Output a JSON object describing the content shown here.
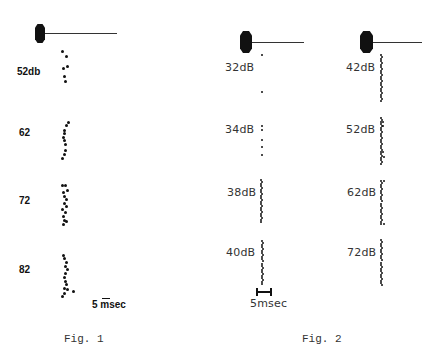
{
  "fig1": {
    "caption": "Fig. 1",
    "scale_label_num": "5",
    "scale_label_unit": "msec",
    "rows": [
      {
        "label": "52db",
        "label_x": 17,
        "label_y": 66
      },
      {
        "label": "62",
        "label_x": 19,
        "label_y": 127
      },
      {
        "label": "72",
        "label_x": 19,
        "label_y": 195
      },
      {
        "label": "82",
        "label_x": 19,
        "label_y": 264
      }
    ]
  },
  "fig2": {
    "caption": "Fig. 2",
    "scale_label": "5msec",
    "columns": [
      {
        "rows": [
          {
            "label": "32dB",
            "label_x": 225,
            "label_y": 61
          },
          {
            "label": "34dB",
            "label_x": 225,
            "label_y": 123
          },
          {
            "label": "38dB",
            "label_x": 227,
            "label_y": 186
          },
          {
            "label": "40dB",
            "label_x": 226,
            "label_y": 246
          }
        ]
      },
      {
        "rows": [
          {
            "label": "42dB",
            "label_x": 346,
            "label_y": 61
          },
          {
            "label": "52dB",
            "label_x": 346,
            "label_y": 123
          },
          {
            "label": "62dB",
            "label_x": 347,
            "label_y": 186
          },
          {
            "label": "72dB",
            "label_x": 347,
            "label_y": 246
          }
        ]
      }
    ]
  },
  "chart_data": [
    {
      "type": "scatter",
      "title": "Fig. 1",
      "xlabel": "time (scale bar 5 msec)",
      "ylabel": "stimulus intensity",
      "series": [
        {
          "name": "52db",
          "points": [
            [
              62,
              51
            ],
            [
              66,
              56
            ],
            [
              63,
              68
            ],
            [
              67,
              66
            ],
            [
              64,
              76
            ],
            [
              65,
              81
            ]
          ]
        },
        {
          "name": "62",
          "points": [
            [
              68,
              122
            ],
            [
              66,
              125
            ],
            [
              64,
              130
            ],
            [
              64,
              133
            ],
            [
              63,
              137
            ],
            [
              64,
              140
            ],
            [
              65,
              144
            ],
            [
              65,
              150
            ],
            [
              64,
              154
            ],
            [
              62,
              158
            ]
          ]
        },
        {
          "name": "72",
          "points": [
            [
              62,
              185
            ],
            [
              65,
              185
            ],
            [
              67,
              190
            ],
            [
              63,
              192
            ],
            [
              64,
              196
            ],
            [
              66,
              199
            ],
            [
              64,
              203
            ],
            [
              66,
              206
            ],
            [
              62,
              209
            ],
            [
              65,
              212
            ],
            [
              63,
              216
            ],
            [
              64,
              220
            ],
            [
              66,
              221
            ],
            [
              63,
              224
            ]
          ]
        },
        {
          "name": "82",
          "points": [
            [
              63,
              255
            ],
            [
              64,
              258
            ],
            [
              66,
              262
            ],
            [
              65,
              266
            ],
            [
              67,
              269
            ],
            [
              65,
              273
            ],
            [
              64,
              277
            ],
            [
              65,
              281
            ],
            [
              66,
              284
            ],
            [
              64,
              288
            ],
            [
              67,
              289
            ],
            [
              64,
              293
            ],
            [
              62,
              296
            ],
            [
              73,
              291
            ]
          ]
        }
      ],
      "scale_bar": {
        "label": "5 msec",
        "x1": 102,
        "x2": 109,
        "y": 299
      }
    },
    {
      "type": "scatter",
      "title": "Fig. 2",
      "xlabel": "time (scale bar 5 msec)",
      "ylabel": "stimulus intensity",
      "series": [
        {
          "name": "32dB",
          "points": [
            [
              262,
              55
            ],
            [
              262,
              92
            ]
          ]
        },
        {
          "name": "34dB",
          "points": [
            [
              262,
              126
            ],
            [
              262,
              130
            ],
            [
              262,
              140
            ],
            [
              262,
              147
            ],
            [
              262,
              155
            ]
          ]
        },
        {
          "name": "38dB",
          "dense_column": {
            "x": 261,
            "y_start": 180,
            "y_end": 222,
            "count": 22
          }
        },
        {
          "name": "40dB",
          "dense_column": {
            "x": 262,
            "y_start": 241,
            "y_end": 284,
            "count": 22
          }
        },
        {
          "name": "42dB",
          "dense_column": {
            "x": 381,
            "y_start": 55,
            "y_end": 101,
            "count": 24
          }
        },
        {
          "name": "52dB",
          "dense_column": {
            "x": 381,
            "y_start": 118,
            "y_end": 164,
            "count": 24
          },
          "extra": [
            [
              383,
              122
            ],
            [
              383,
              126
            ],
            [
              383,
              152
            ],
            [
              384,
              157
            ]
          ]
        },
        {
          "name": "62dB",
          "dense_column": {
            "x": 381,
            "y_start": 181,
            "y_end": 224,
            "count": 22
          },
          "extra": [
            [
              384,
              181
            ],
            [
              384,
              224
            ]
          ]
        },
        {
          "name": "72dB",
          "dense_column": {
            "x": 381,
            "y_start": 240,
            "y_end": 285,
            "count": 23
          }
        }
      ],
      "scale_bar": {
        "label": "5msec",
        "x1": 256,
        "x2": 271,
        "y": 292
      }
    }
  ]
}
